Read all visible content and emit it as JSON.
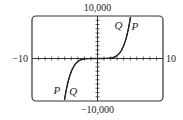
{
  "chart_data": {
    "type": "line",
    "title": "",
    "xlabel": "",
    "ylabel": "",
    "xlim": [
      -10,
      10
    ],
    "ylim": [
      -10000,
      10000
    ],
    "x_tick_step": 1,
    "y_tick_step": 1000,
    "grid": false,
    "axis_labels": {
      "x_min": "−10",
      "x_max": "10",
      "y_max": "10,000",
      "y_min": "−10,000"
    },
    "series": [
      {
        "name": "P",
        "x": [
          -5.04,
          -4.5,
          -4,
          -3.5,
          -3,
          -2.5,
          -2,
          -1,
          0,
          1,
          2,
          2.5,
          3,
          3.5,
          4,
          4.5,
          5.04
        ],
        "values": [
          -10000,
          -5536,
          -3072,
          -1582,
          -729,
          -293,
          -96,
          -3,
          0,
          3,
          96,
          293,
          729,
          1582,
          3072,
          5536,
          10000
        ]
      },
      {
        "name": "Q",
        "x": [
          -5.04,
          -4.5,
          -4,
          -3.5,
          -3,
          -2.5,
          -2,
          -1,
          0,
          1,
          2,
          2.5,
          3,
          3.5,
          4,
          4.5,
          5.04
        ],
        "values": [
          -10000,
          -5536,
          -3072,
          -1582,
          -729,
          -293,
          -96,
          -3,
          0,
          3,
          96,
          293,
          729,
          1582,
          3072,
          5536,
          10000
        ]
      }
    ],
    "annotations": [
      {
        "text": "Q",
        "x": 3.2,
        "y": 7800
      },
      {
        "text": "P",
        "x": 5.7,
        "y": 7600
      },
      {
        "text": "P",
        "x": -6.2,
        "y": -7400
      },
      {
        "text": "Q",
        "x": -3.7,
        "y": -7600
      }
    ]
  }
}
